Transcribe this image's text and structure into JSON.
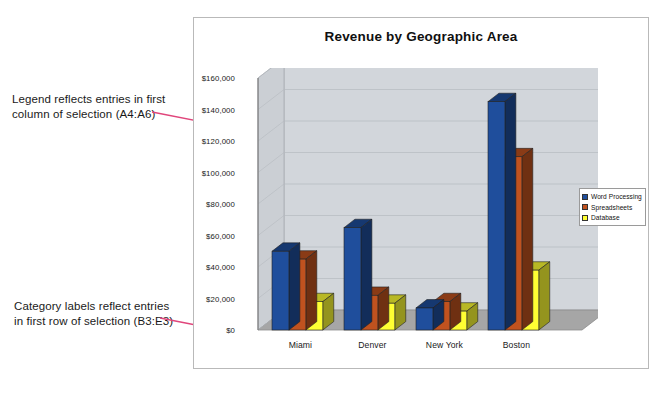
{
  "annotations": {
    "legend_note": "Legend reflects entries in first\ncolumn of selection (A4:A6)",
    "category_note": "Category labels reflect entries\nin first row of selection (B3:E3)",
    "leader_color": "#E0457B"
  },
  "chart_frame": {
    "border_color": "#b9b9b9",
    "background": "#ffffff"
  },
  "legend": {
    "position": "right",
    "entries": [
      {
        "label": "Word Processing",
        "color": "#1F4E9C"
      },
      {
        "label": "Spreadsheets",
        "color": "#C0521F"
      },
      {
        "label": "Database",
        "color": "#FFFF33"
      }
    ]
  },
  "chart_data": {
    "type": "bar",
    "title": "Revenue by Geographic Area",
    "xlabel": "",
    "ylabel": "",
    "categories": [
      "Miami",
      "Denver",
      "New York",
      "Boston"
    ],
    "series": [
      {
        "name": "Word Processing",
        "color": "#1F4E9C",
        "values": [
          50000,
          65000,
          14000,
          145000
        ]
      },
      {
        "name": "Spreadsheets",
        "color": "#C0521F",
        "values": [
          45000,
          22000,
          18000,
          110000
        ]
      },
      {
        "name": "Database",
        "color": "#FFFF33",
        "values": [
          18000,
          17000,
          12000,
          38000
        ]
      }
    ],
    "ylim": [
      0,
      160000
    ],
    "ytick_step": 20000,
    "ytick_labels": [
      "$160,000",
      "$140,000",
      "$120,000",
      "$100,000",
      "$80,000",
      "$60,000",
      "$40,000",
      "$20,000",
      "$0"
    ],
    "grid": true,
    "legend_position": "right",
    "three_d": true,
    "plot_background": "#D2D6DB",
    "floor_color": "#9A9A9A"
  }
}
